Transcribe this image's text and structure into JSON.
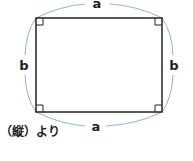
{
  "diagram": {
    "shape": "rectangle",
    "labels": {
      "top": "a",
      "bottom": "a",
      "left": "b",
      "right": "b"
    },
    "right_angle_markers": 4,
    "colors": {
      "rectangle_stroke": "#222222",
      "arc_stroke": "#8fb4d6",
      "label": "#222222"
    }
  },
  "caption": "（縦）より"
}
